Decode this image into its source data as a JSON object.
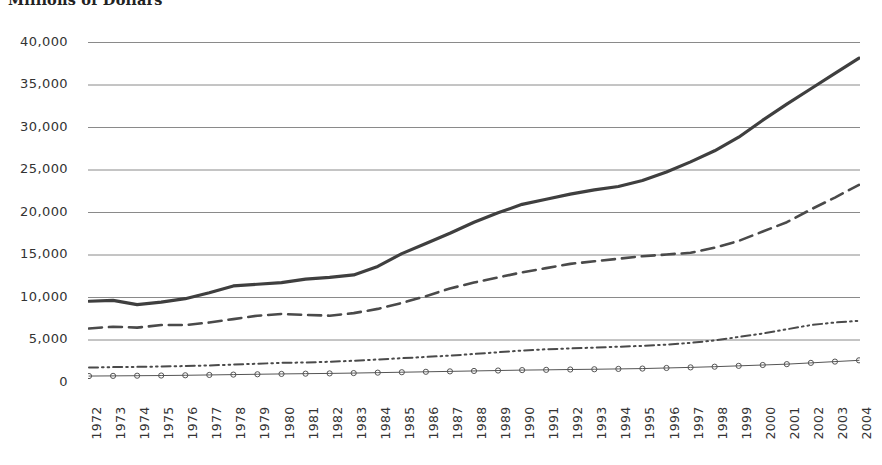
{
  "chart_data": {
    "type": "line",
    "title": "Millions of Dollars",
    "xlabel": "",
    "ylabel": "",
    "grid": true,
    "legend_position": "none",
    "ylim": [
      0,
      40000
    ],
    "yticks": [
      "0",
      "5,000",
      "10,000",
      "15,000",
      "20,000",
      "25,000",
      "30,000",
      "35,000",
      "40,000"
    ],
    "ytick_values": [
      0,
      5000,
      10000,
      15000,
      20000,
      25000,
      30000,
      35000,
      40000
    ],
    "categories": [
      "1972",
      "1973",
      "1974",
      "1975",
      "1976",
      "1977",
      "1978",
      "1979",
      "1980",
      "1981",
      "1982",
      "1983",
      "1984",
      "1985",
      "1986",
      "1987",
      "1988",
      "1989",
      "1990",
      "1991",
      "1992",
      "1993",
      "1994",
      "1995",
      "1996",
      "1997",
      "1998",
      "1999",
      "2000",
      "2001",
      "2002",
      "2003",
      "2004"
    ],
    "series": [
      {
        "name": "series-1-solid",
        "style": "solid",
        "color": "#3f3f3f",
        "width": 3.2,
        "marker": "none",
        "values": [
          9500,
          9600,
          9100,
          9400,
          9800,
          10500,
          11300,
          11500,
          11700,
          12100,
          12300,
          12600,
          13600,
          15100,
          16300,
          17500,
          18800,
          19900,
          20900,
          21500,
          22100,
          22600,
          23000,
          23700,
          24700,
          25900,
          27200,
          28800,
          30800,
          32700,
          34500,
          36300,
          38100
        ]
      },
      {
        "name": "series-2-dashed",
        "style": "dashed",
        "color": "#4a4a4a",
        "width": 2.6,
        "marker": "none",
        "values": [
          6300,
          6500,
          6400,
          6700,
          6700,
          7000,
          7400,
          7800,
          8000,
          7900,
          7800,
          8100,
          8600,
          9300,
          10100,
          11000,
          11700,
          12300,
          12900,
          13400,
          13900,
          14200,
          14500,
          14800,
          15000,
          15200,
          15800,
          16600,
          17700,
          18800,
          20300,
          21700,
          23200
        ]
      },
      {
        "name": "series-3-dash-dot-dot",
        "style": "dash-dot-dot",
        "color": "#4a4a4a",
        "width": 2.0,
        "marker": "none",
        "values": [
          1700,
          1750,
          1780,
          1820,
          1880,
          1950,
          2050,
          2150,
          2250,
          2300,
          2380,
          2500,
          2650,
          2800,
          2950,
          3100,
          3300,
          3500,
          3700,
          3850,
          3950,
          4050,
          4150,
          4250,
          4400,
          4600,
          4900,
          5300,
          5700,
          6200,
          6700,
          7000,
          7200
        ]
      },
      {
        "name": "series-4-markers",
        "style": "solid-thin-marker",
        "color": "#555555",
        "width": 1.0,
        "marker": "circle",
        "values": [
          700,
          720,
          740,
          760,
          790,
          830,
          870,
          910,
          950,
          980,
          1010,
          1050,
          1100,
          1150,
          1200,
          1250,
          1300,
          1350,
          1400,
          1430,
          1470,
          1500,
          1540,
          1580,
          1650,
          1720,
          1800,
          1900,
          2000,
          2100,
          2250,
          2400,
          2550
        ]
      }
    ]
  },
  "colors": {
    "background": "#ffffff",
    "gridline": "#7d7d7d",
    "axis_text": "#333333",
    "title_text": "#222222"
  }
}
